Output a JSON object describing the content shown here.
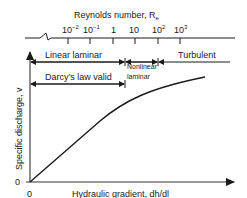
{
  "diagram": {
    "reynolds_axis": {
      "title": "Reynolds number, R",
      "title_subscript": "e",
      "ticks": [
        {
          "base": "10",
          "exp": "−2"
        },
        {
          "base": "10",
          "exp": "−1"
        },
        {
          "base": "1",
          "exp": ""
        },
        {
          "base": "10",
          "exp": ""
        },
        {
          "base": "10",
          "exp": "2"
        },
        {
          "base": "10",
          "exp": "3"
        }
      ]
    },
    "regimes": {
      "linear_laminar": "Linear laminar",
      "nonlinear_laminar_line1": "Nonlinear",
      "nonlinear_laminar_line2": "laminar",
      "turbulent": "Turbulent",
      "darcy": "Darcy’s law valid"
    },
    "y_axis": {
      "label": "Specific discharge, v",
      "origin": "0"
    },
    "x_axis": {
      "label": "Hydraulic gradient, dh/dl",
      "origin": "0"
    }
  }
}
